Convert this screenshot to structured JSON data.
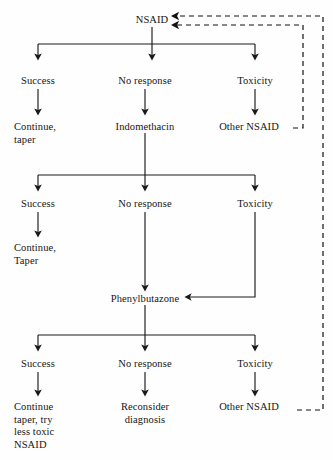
{
  "diagram": {
    "type": "flowchart",
    "background_color": "#fefefe",
    "line_color": "#1a1a1a",
    "text_color": "#151515",
    "width": 333,
    "height": 460
  },
  "nodes": [
    {
      "id": "nsaid",
      "label": "NSAID",
      "x": 152,
      "y": 14,
      "align": "center"
    },
    {
      "id": "success1",
      "label": "Success",
      "x": 38,
      "y": 75,
      "align": "center"
    },
    {
      "id": "noresponse1",
      "label": "No response",
      "x": 145,
      "y": 75,
      "align": "center"
    },
    {
      "id": "toxicity1",
      "label": "Toxicity",
      "x": 255,
      "y": 75,
      "align": "center"
    },
    {
      "id": "continue-taper1",
      "label": "Continue,\ntaper",
      "x": 14,
      "y": 121,
      "align": "left"
    },
    {
      "id": "indomethacin",
      "label": "Indomethacin",
      "x": 145,
      "y": 121,
      "align": "center"
    },
    {
      "id": "other-nsaid1",
      "label": "Other NSAID",
      "x": 249,
      "y": 121,
      "align": "center"
    },
    {
      "id": "success2",
      "label": "Success",
      "x": 38,
      "y": 198,
      "align": "center"
    },
    {
      "id": "noresponse2",
      "label": "No response",
      "x": 145,
      "y": 198,
      "align": "center"
    },
    {
      "id": "toxicity2",
      "label": "Toxicity",
      "x": 255,
      "y": 198,
      "align": "center"
    },
    {
      "id": "continue-taper2",
      "label": "Continue,\nTaper",
      "x": 14,
      "y": 242,
      "align": "left"
    },
    {
      "id": "phenylbutazone",
      "label": "Phenylbutazone",
      "x": 145,
      "y": 293,
      "align": "center"
    },
    {
      "id": "success3",
      "label": "Success",
      "x": 38,
      "y": 358,
      "align": "center"
    },
    {
      "id": "noresponse3",
      "label": "No response",
      "x": 145,
      "y": 358,
      "align": "center"
    },
    {
      "id": "toxicity3",
      "label": "Toxicity",
      "x": 255,
      "y": 358,
      "align": "center"
    },
    {
      "id": "continue-taper3",
      "label": "Continue\ntaper, try\nless toxic\nNSAID",
      "x": 14,
      "y": 401,
      "align": "left"
    },
    {
      "id": "reconsider",
      "label": "Reconsider\ndiagnosis",
      "x": 145,
      "y": 401,
      "align": "center"
    },
    {
      "id": "other-nsaid3",
      "label": "Other NSAID",
      "x": 249,
      "y": 401,
      "align": "center"
    }
  ],
  "edges": [
    {
      "id": "nsaid-to-bar1",
      "kind": "solid",
      "desc": "NSAID down to branch bar 1"
    },
    {
      "id": "bar1",
      "kind": "solid",
      "desc": "branch bar level 1"
    },
    {
      "id": "bar1-success",
      "kind": "solid-arrow",
      "desc": "branch to Success"
    },
    {
      "id": "bar1-noresponse",
      "kind": "solid-arrow",
      "desc": "branch to No response"
    },
    {
      "id": "bar1-toxicity",
      "kind": "solid-arrow",
      "desc": "branch to Toxicity"
    },
    {
      "id": "success1-continue",
      "kind": "solid-arrow",
      "desc": "Success to Continue, taper"
    },
    {
      "id": "noresponse1-indomethacin",
      "kind": "solid-arrow",
      "desc": "No response to Indomethacin"
    },
    {
      "id": "toxicity1-othernsaid",
      "kind": "solid-arrow",
      "desc": "Toxicity to Other NSAID"
    },
    {
      "id": "indomethacin-to-bar2",
      "kind": "solid-arrow",
      "desc": "Indomethacin down to branch bar 2"
    },
    {
      "id": "bar2",
      "kind": "solid",
      "desc": "branch bar level 2"
    },
    {
      "id": "bar2-success",
      "kind": "solid-arrow",
      "desc": "branch to Success"
    },
    {
      "id": "bar2-toxicity",
      "kind": "solid-arrow",
      "desc": "branch to Toxicity"
    },
    {
      "id": "success2-continue",
      "kind": "solid-arrow",
      "desc": "Success to Continue, Taper"
    },
    {
      "id": "noresponse2-phenylbutazone",
      "kind": "solid-arrow",
      "desc": "No response to Phenylbutazone"
    },
    {
      "id": "toxicity2-phenylbutazone",
      "kind": "solid-arrow",
      "desc": "Toxicity routed left into Phenylbutazone"
    },
    {
      "id": "phenylbutazone-to-bar3",
      "kind": "solid-arrow",
      "desc": "Phenylbutazone down to branch bar 3"
    },
    {
      "id": "bar3",
      "kind": "solid",
      "desc": "branch bar level 3"
    },
    {
      "id": "bar3-success",
      "kind": "solid-arrow",
      "desc": "branch to Success"
    },
    {
      "id": "bar3-toxicity",
      "kind": "solid-arrow",
      "desc": "branch to Toxicity"
    },
    {
      "id": "success3-continue",
      "kind": "solid-arrow",
      "desc": "Success to Continue taper"
    },
    {
      "id": "noresponse3-reconsider",
      "kind": "solid-arrow",
      "desc": "No response to Reconsider diagnosis"
    },
    {
      "id": "toxicity3-othernsaid",
      "kind": "solid-arrow",
      "desc": "Toxicity to Other NSAID"
    },
    {
      "id": "feedback-upper",
      "kind": "dashed-arrow",
      "desc": "Other NSAID (bottom) dashed feedback to NSAID"
    },
    {
      "id": "feedback-lower",
      "kind": "dashed-arrow",
      "desc": "Other NSAID (top) dashed feedback to NSAID"
    }
  ]
}
